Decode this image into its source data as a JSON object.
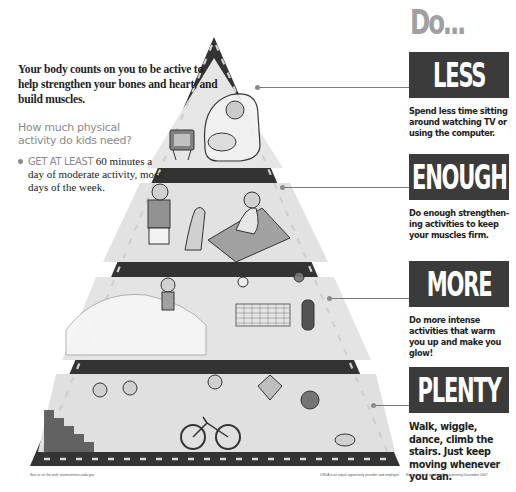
{
  "intro": {
    "lead": "Your body counts on you to be active to help strengthen your bones and heart, and build muscles.",
    "question": "How much physical activity do kids need?",
    "bullet_strong": "GET AT LEAST",
    "bullet_rest": " 60 minutes a day of moderate activity, most days of the week."
  },
  "heading": "Do...",
  "levels": [
    {
      "word": "LESS",
      "description": "Spend less time sitting around watching TV or using the computer.",
      "illustration": "child lounging in armchair with TV"
    },
    {
      "word": "ENOUGH",
      "description": "Do enough strengthen-ing activities to keep your muscles firm.",
      "illustration": "kids stretching and doing sit-ups with dog"
    },
    {
      "word": "MORE",
      "description": "Do more intense activities that warm you up and make you glow!",
      "illustration": "kids skating, playing volleyball and basketball"
    },
    {
      "word": "PLENTY",
      "description": "Walk, wiggle, dance, climb the stairs. Just keep moving whenever you can.",
      "illustration": "kids climbing stairs, walking, biking, flying kite, playing with dog"
    }
  ],
  "footer": {
    "left": "See us on the web: teamnutrition.usda.gov",
    "center": "USDA is an equal opportunity provider and employer.",
    "right": "Reviewed and approved for reprinting December 2007"
  },
  "colors": {
    "box": "#3b3b3b",
    "frame": "#3a3a3a",
    "heading_gray": "#a0a0a0",
    "tier_fill": "#e4e4e4"
  }
}
